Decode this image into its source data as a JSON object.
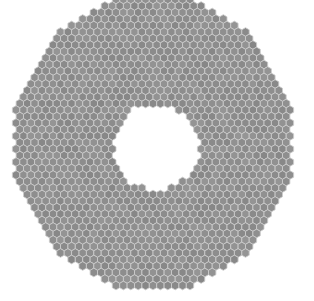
{
  "figure": {
    "type": "hexagonal-segmented-mirror-array",
    "canvas": {
      "width": 314,
      "height": 301
    },
    "grid": {
      "center_x": 153,
      "center_y": 142.5,
      "pitch_x": 7.4,
      "pitch_y": 6.5,
      "col_span": 22,
      "row_span": 23
    },
    "hex": {
      "orientation": "pointy-top",
      "half_width": 3.7,
      "corner_radius": 4.35
    },
    "outer_boundary": {
      "shape": "dodecagon",
      "inradius_x": 138,
      "inradius_y": 144.5,
      "edge_normals_deg": [
        0,
        30,
        60,
        90,
        120,
        150,
        180,
        210,
        240,
        270,
        300,
        330
      ]
    },
    "central_hole": {
      "shape": "circle",
      "center_x": 156,
      "center_y": 147,
      "exclude_radius": 43
    },
    "colors": {
      "background": "#ffffff",
      "segment_base_gray": 142,
      "segment_gray_variation": 14,
      "gap_line": "#cccccc",
      "gap_line_width": 0.85
    }
  }
}
